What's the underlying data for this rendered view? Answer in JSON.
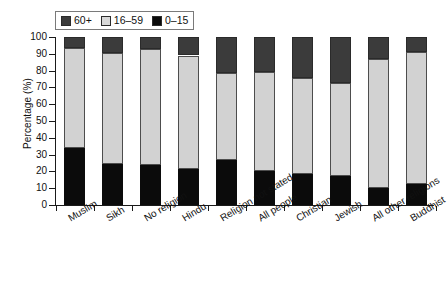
{
  "chart_data": {
    "type": "bar",
    "subtype": "stacked-bar-100",
    "title": "",
    "xlabel": "",
    "ylabel": "Percentage (%)",
    "ylim": [
      0,
      100
    ],
    "ytick_step": 10,
    "yticks": [
      100,
      90,
      80,
      70,
      60,
      50,
      40,
      30,
      20,
      10,
      0
    ],
    "grid": false,
    "legend_position": "top-left",
    "categories": [
      "Muslim",
      "Sikh",
      "No religion",
      "Hindu",
      "Religion not stated",
      "All people",
      "Christian",
      "Jewish",
      "All other religions",
      "Buddhist"
    ],
    "series": [
      {
        "name": "0–15",
        "color": "#0b0b0b",
        "values": [
          34.0,
          24.5,
          24.0,
          21.5,
          26.5,
          20.5,
          18.5,
          17.5,
          10.0,
          12.5
        ]
      },
      {
        "name": "16–59",
        "color": "#d2d2d2",
        "values": [
          59.5,
          66.0,
          69.0,
          67.5,
          52.0,
          58.5,
          57.0,
          55.0,
          77.0,
          78.5
        ]
      },
      {
        "name": "60+",
        "color": "#3b3b3b",
        "values": [
          6.5,
          9.5,
          7.0,
          11.0,
          21.5,
          21.0,
          24.5,
          27.5,
          13.0,
          9.0
        ]
      }
    ],
    "cumulative_tops": {
      "0–15": [
        34.0,
        24.5,
        24.0,
        21.5,
        26.5,
        20.5,
        18.5,
        17.5,
        10.0,
        12.5
      ],
      "16–59": [
        93.5,
        90.5,
        93.0,
        89.0,
        78.5,
        79.0,
        75.5,
        72.5,
        87.0,
        91.0
      ],
      "60+": [
        100,
        100,
        100,
        100,
        100,
        100,
        100,
        100,
        100,
        100
      ]
    }
  },
  "legend": {
    "items": [
      {
        "label": "60+",
        "color": "#3b3b3b"
      },
      {
        "label": "16–59",
        "color": "#d2d2d2"
      },
      {
        "label": "0–15",
        "color": "#0b0b0b"
      }
    ]
  },
  "axes": {
    "y_title": "Percentage (%)"
  }
}
